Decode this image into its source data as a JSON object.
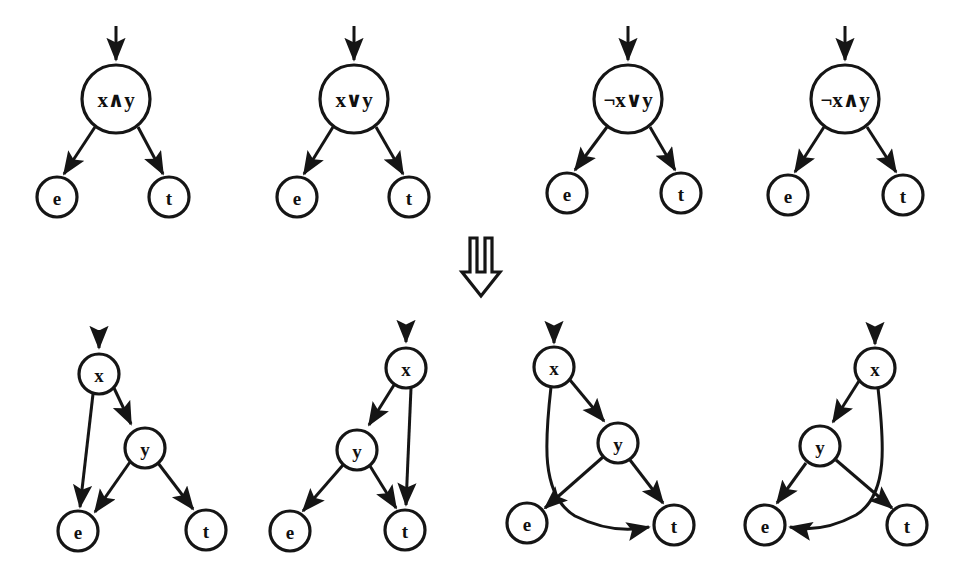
{
  "figure": {
    "background_color": "#ffffff",
    "ink_color": "#151515",
    "width": 963,
    "height": 576,
    "transform_symbol": "double-down-arrow",
    "transform_symbol_char": "⇓"
  },
  "top_row": {
    "caption": "Single-node guarded branches",
    "graphs": [
      {
        "id": "top-and",
        "label": "x∧y",
        "operator": "and",
        "root": {
          "name": "root",
          "label": "x∧y",
          "cx": 116,
          "cy": 99,
          "r": 34
        },
        "leaves": [
          {
            "name": "e",
            "label": "e",
            "cx": 57,
            "cy": 197,
            "r": 20
          },
          {
            "name": "t",
            "label": "t",
            "cx": 169,
            "cy": 197,
            "r": 20
          }
        ],
        "entry_arrow": {
          "x": 116,
          "y_from": 26,
          "y_to": 62
        },
        "edges": [
          {
            "from": "root",
            "to": "e"
          },
          {
            "from": "root",
            "to": "t"
          }
        ]
      },
      {
        "id": "top-or",
        "label": "x∨y",
        "operator": "or",
        "root": {
          "name": "root",
          "label": "x∨y",
          "cx": 354,
          "cy": 99,
          "r": 34
        },
        "leaves": [
          {
            "name": "e",
            "label": "e",
            "cx": 297,
            "cy": 197,
            "r": 20
          },
          {
            "name": "t",
            "label": "t",
            "cx": 409,
            "cy": 197,
            "r": 20
          }
        ],
        "entry_arrow": {
          "x": 354,
          "y_from": 26,
          "y_to": 62
        },
        "edges": [
          {
            "from": "root",
            "to": "e"
          },
          {
            "from": "root",
            "to": "t"
          }
        ]
      },
      {
        "id": "top-notor",
        "label": "¬x∨y",
        "operator": "not-or",
        "root": {
          "name": "root",
          "label": "¬x∨y",
          "cx": 628,
          "cy": 99,
          "r": 34
        },
        "leaves": [
          {
            "name": "e",
            "label": "e",
            "cx": 567,
            "cy": 193,
            "r": 20
          },
          {
            "name": "t",
            "label": "t",
            "cx": 681,
            "cy": 193,
            "r": 20
          }
        ],
        "entry_arrow": {
          "x": 628,
          "y_from": 26,
          "y_to": 62
        },
        "edges": [
          {
            "from": "root",
            "to": "e"
          },
          {
            "from": "root",
            "to": "t"
          }
        ]
      },
      {
        "id": "top-notand",
        "label": "¬x∧y",
        "operator": "not-and",
        "root": {
          "name": "root",
          "label": "¬x∧y",
          "cx": 845,
          "cy": 99,
          "r": 34
        },
        "leaves": [
          {
            "name": "e",
            "label": "e",
            "cx": 788,
            "cy": 195,
            "r": 20
          },
          {
            "name": "t",
            "label": "t",
            "cx": 903,
            "cy": 195,
            "r": 20
          }
        ],
        "entry_arrow": {
          "x": 845,
          "y_from": 26,
          "y_to": 62
        },
        "edges": [
          {
            "from": "root",
            "to": "e"
          },
          {
            "from": "root",
            "to": "t"
          }
        ]
      }
    ]
  },
  "bottom_row": {
    "caption": "Expanded two-test control-flow graphs",
    "graphs": [
      {
        "id": "bot-and",
        "expands": "x∧y",
        "nodes": [
          {
            "name": "x",
            "label": "x",
            "cx": 99,
            "cy": 374,
            "r": 20
          },
          {
            "name": "y",
            "label": "y",
            "cx": 145,
            "cy": 448,
            "r": 20
          },
          {
            "name": "e",
            "label": "e",
            "cx": 78,
            "cy": 531,
            "r": 20
          },
          {
            "name": "t",
            "label": "t",
            "cx": 206,
            "cy": 530,
            "r": 20
          }
        ],
        "entry_arrow": {
          "x": 99,
          "y_from": 330,
          "y_to": 350
        },
        "edges": [
          {
            "from": "x",
            "to": "e",
            "style": "straight"
          },
          {
            "from": "x",
            "to": "y",
            "style": "straight"
          },
          {
            "from": "y",
            "to": "e",
            "style": "straight"
          },
          {
            "from": "y",
            "to": "t",
            "style": "straight"
          }
        ]
      },
      {
        "id": "bot-or",
        "expands": "x∨y",
        "nodes": [
          {
            "name": "x",
            "label": "x",
            "cx": 406,
            "cy": 368,
            "r": 20
          },
          {
            "name": "y",
            "label": "y",
            "cx": 357,
            "cy": 450,
            "r": 20
          },
          {
            "name": "e",
            "label": "e",
            "cx": 290,
            "cy": 531,
            "r": 20
          },
          {
            "name": "t",
            "label": "t",
            "cx": 405,
            "cy": 530,
            "r": 20
          }
        ],
        "entry_arrow": {
          "x": 406,
          "y_from": 326,
          "y_to": 344
        },
        "edges": [
          {
            "from": "x",
            "to": "y",
            "style": "straight"
          },
          {
            "from": "x",
            "to": "t",
            "style": "straight"
          },
          {
            "from": "y",
            "to": "e",
            "style": "straight"
          },
          {
            "from": "y",
            "to": "t",
            "style": "straight"
          }
        ]
      },
      {
        "id": "bot-notor",
        "expands": "¬x∨y",
        "nodes": [
          {
            "name": "x",
            "label": "x",
            "cx": 554,
            "cy": 367,
            "r": 20
          },
          {
            "name": "y",
            "label": "y",
            "cx": 618,
            "cy": 443,
            "r": 20
          },
          {
            "name": "e",
            "label": "e",
            "cx": 527,
            "cy": 523,
            "r": 20
          },
          {
            "name": "t",
            "label": "t",
            "cx": 674,
            "cy": 525,
            "r": 20
          }
        ],
        "entry_arrow": {
          "x": 554,
          "y_from": 328,
          "y_to": 343
        },
        "edges": [
          {
            "from": "x",
            "to": "t",
            "style": "curved"
          },
          {
            "from": "x",
            "to": "y",
            "style": "straight"
          },
          {
            "from": "y",
            "to": "e",
            "style": "straight"
          },
          {
            "from": "y",
            "to": "t",
            "style": "straight"
          }
        ]
      },
      {
        "id": "bot-notand",
        "expands": "¬x∧y",
        "nodes": [
          {
            "name": "x",
            "label": "x",
            "cx": 875,
            "cy": 368,
            "r": 20
          },
          {
            "name": "y",
            "label": "y",
            "cx": 820,
            "cy": 446,
            "r": 20
          },
          {
            "name": "e",
            "label": "e",
            "cx": 765,
            "cy": 525,
            "r": 20
          },
          {
            "name": "t",
            "label": "t",
            "cx": 907,
            "cy": 525,
            "r": 20
          }
        ],
        "entry_arrow": {
          "x": 875,
          "y_from": 328,
          "y_to": 344
        },
        "edges": [
          {
            "from": "x",
            "to": "e",
            "style": "curved"
          },
          {
            "from": "x",
            "to": "y",
            "style": "straight"
          },
          {
            "from": "y",
            "to": "e",
            "style": "straight"
          },
          {
            "from": "y",
            "to": "t",
            "style": "straight"
          }
        ]
      }
    ]
  }
}
